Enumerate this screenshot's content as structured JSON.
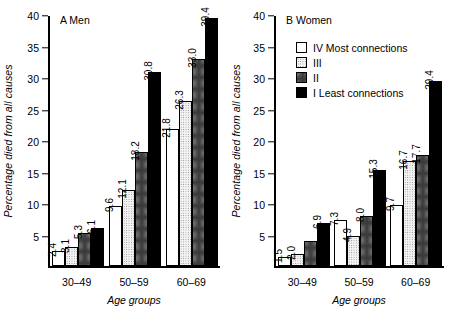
{
  "figure": {
    "ylabel": "Percentage died from all causes",
    "xlabel": "Age groups"
  },
  "panels": [
    {
      "title": "A Men"
    },
    {
      "title": "B Women"
    }
  ],
  "legend": {
    "items": [
      {
        "label": "IV Most connections",
        "key": "IV",
        "swatch": "white-swatch"
      },
      {
        "label": "III",
        "key": "III",
        "swatch": "light-dotted-swatch"
      },
      {
        "label": "II",
        "key": "II",
        "swatch": "dense-dotted-swatch"
      },
      {
        "label": "I Least connections",
        "key": "I",
        "swatch": "black-swatch"
      }
    ]
  },
  "axis": {
    "yticks": [
      "0",
      "5",
      "10",
      "15",
      "20",
      "25",
      "30",
      "35",
      "40"
    ],
    "xcats": [
      "30–49",
      "50–59",
      "60–69"
    ]
  },
  "chart_data": [
    {
      "type": "bar",
      "title": "A Men",
      "xlabel": "Age groups",
      "ylabel": "Percentage died from all causes",
      "ylim": [
        0,
        40
      ],
      "ytick_step": 5,
      "grid": false,
      "legend_position": "none",
      "categories": [
        "30–49",
        "50–59",
        "60–69"
      ],
      "series": [
        {
          "name": "IV Most connections",
          "values": [
            2.4,
            9.6,
            21.8
          ],
          "labels": [
            "2.4",
            "9.6",
            "21.8"
          ]
        },
        {
          "name": "III",
          "values": [
            3.1,
            12.1,
            26.3
          ],
          "labels": [
            "3.1",
            "12.1",
            "26.3"
          ]
        },
        {
          "name": "II",
          "values": [
            5.3,
            18.2,
            33.0
          ],
          "labels": [
            "5.3",
            "18.2",
            "33.0"
          ]
        },
        {
          "name": "I Least connections",
          "values": [
            6.1,
            30.8,
            39.4
          ],
          "labels": [
            "6.1",
            "30.8",
            "39.4"
          ]
        }
      ]
    },
    {
      "type": "bar",
      "title": "B Women",
      "xlabel": "Age groups",
      "ylabel": "Percentage died from all causes",
      "ylim": [
        0,
        40
      ],
      "ytick_step": 5,
      "grid": false,
      "legend_position": "upper-left",
      "categories": [
        "30–49",
        "50–59",
        "60–69"
      ],
      "series": [
        {
          "name": "IV Most connections",
          "values": [
            1.5,
            7.3,
            9.7
          ],
          "labels": [
            "1.5",
            "7.3",
            "9.7"
          ]
        },
        {
          "name": "III",
          "values": [
            2.0,
            4.9,
            16.7
          ],
          "labels": [
            "2.0",
            "4.9",
            "16.7"
          ]
        },
        {
          "name": "II",
          "values": [
            4.1,
            8.0,
            17.7
          ],
          "labels": [
            "",
            "8.0",
            "17.7"
          ]
        },
        {
          "name": "I Least connections",
          "values": [
            6.9,
            15.3,
            29.4
          ],
          "labels": [
            "6.9",
            "15.3",
            "29.4"
          ]
        }
      ]
    }
  ]
}
